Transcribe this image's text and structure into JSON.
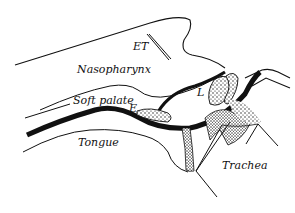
{
  "diagram": {
    "type": "anatomical-sagittal-section",
    "labels": {
      "et": "ET",
      "nasopharynx": "Nasopharynx",
      "soft_palate": "Soft palate",
      "e": "E",
      "l": "L",
      "tongue": "Tongue",
      "trachea": "Trachea"
    },
    "colors": {
      "ink": "#111111",
      "background": "#ffffff"
    }
  }
}
